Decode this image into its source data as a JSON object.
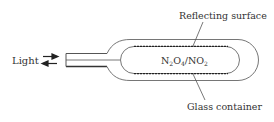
{
  "diagram": {
    "labels": {
      "light": "Light",
      "reflecting_surface": "Reflecting surface",
      "glass_container": "Glass container",
      "gas_prefix": "N",
      "gas_sub1": "2",
      "gas_mid": "O",
      "gas_sub2": "4",
      "gas_slash": "/NO",
      "gas_sub3": "2"
    },
    "colors": {
      "stroke": "#555555",
      "text": "#333333",
      "background": "#ffffff"
    },
    "icons": {
      "light_arrows": "bidirectional-arrows-icon"
    }
  }
}
